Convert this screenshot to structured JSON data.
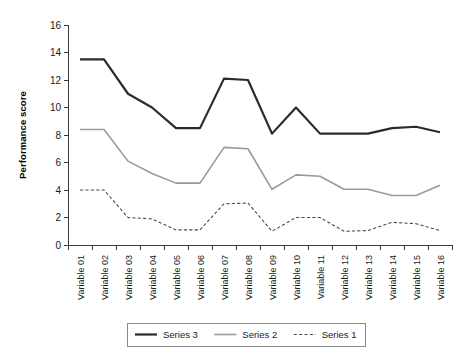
{
  "chart_data": {
    "type": "line",
    "title": "",
    "xlabel": "",
    "ylabel": "Performance score",
    "ylim": [
      0,
      16
    ],
    "yticks": [
      0,
      2,
      4,
      6,
      8,
      10,
      12,
      14,
      16
    ],
    "grid": false,
    "legend_position": "bottom",
    "categories": [
      "Variable 01",
      "Variable 02",
      "Variable 03",
      "Variable 04",
      "Variable 05",
      "Variable 06",
      "Variable 07",
      "Variable 08",
      "Variable 09",
      "Variable 10",
      "Variable 11",
      "Variable 12",
      "Variable 13",
      "Variable 14",
      "Variable 15",
      "Variable 16"
    ],
    "series": [
      {
        "name": "Series 3",
        "color": "#2b2b2b",
        "style": "solid",
        "width": 2.2,
        "values": [
          13.5,
          13.5,
          11.0,
          10.0,
          8.5,
          8.5,
          12.1,
          12.0,
          8.1,
          10.0,
          8.1,
          8.1,
          8.1,
          8.5,
          8.6,
          8.2
        ]
      },
      {
        "name": "Series 2",
        "color": "#9a9a9a",
        "style": "solid",
        "width": 1.6,
        "values": [
          8.4,
          8.4,
          6.1,
          5.2,
          4.5,
          4.5,
          7.1,
          7.0,
          4.05,
          5.1,
          5.0,
          4.05,
          4.05,
          3.6,
          3.6,
          4.35
        ]
      },
      {
        "name": "Series 1",
        "color": "#4a4a4a",
        "style": "dashed",
        "width": 1.1,
        "values": [
          4.0,
          4.0,
          2.0,
          1.9,
          1.1,
          1.1,
          3.0,
          3.05,
          1.0,
          2.0,
          2.0,
          1.0,
          1.05,
          1.65,
          1.55,
          1.05
        ]
      }
    ],
    "legend_entries": [
      {
        "label": "Series 3",
        "color": "#2b2b2b",
        "style": "solid",
        "width": 2.2
      },
      {
        "label": "Series 2",
        "color": "#9a9a9a",
        "style": "solid",
        "width": 1.6
      },
      {
        "label": "Series 1",
        "color": "#4a4a4a",
        "style": "dashed",
        "width": 1.1
      }
    ]
  },
  "colors": {
    "background": "#ffffff",
    "axis": "#3a3a3a",
    "text": "#1a1a1a",
    "legend_border": "#8a8a8a"
  }
}
